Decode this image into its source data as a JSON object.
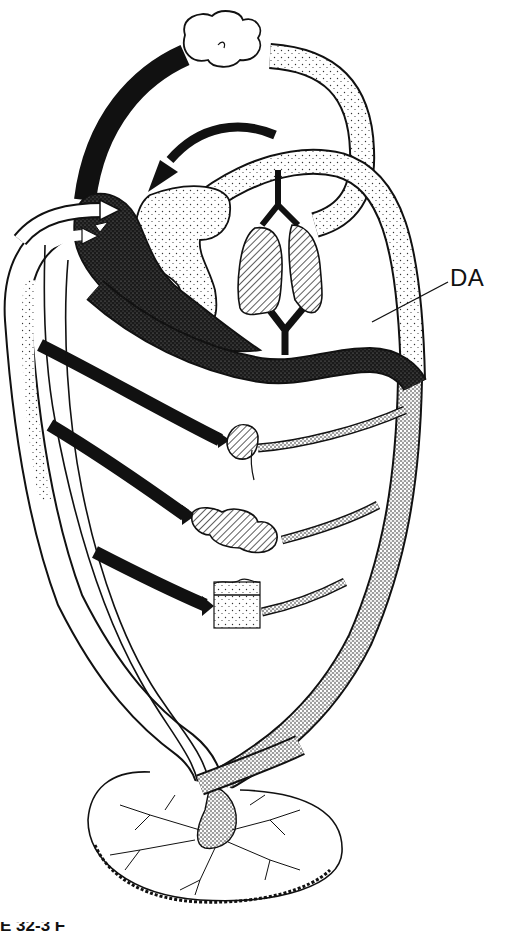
{
  "figure": {
    "labels": [
      {
        "id": "ductus-arteriosus",
        "text": "DA"
      }
    ],
    "caption_fragment": "E 32-3 F",
    "structures": [
      "placenta",
      "umbilical-cord",
      "umbilical-vein",
      "umbilical-arteries",
      "heart-right-atrium",
      "heart-left-atrium",
      "heart-ventricles",
      "pulmonary-trunk",
      "lungs",
      "ductus-arteriosus",
      "aorta",
      "head-circulation",
      "liver",
      "gut",
      "lower-body-tissue",
      "inferior-vena-cava",
      "superior-vena-cava"
    ],
    "shading_legend": {
      "black": "deoxygenated / low-oxygen blood",
      "fine-stipple": "mixed blood",
      "dense-stipple": "oxygenated-mixed arterial blood",
      "white": "oxygenated blood from placenta",
      "hatched": "organs (lungs, liver, gut)"
    },
    "colors": {
      "ink": "#111111",
      "paper": "#ffffff",
      "hatch": "#555555"
    }
  }
}
